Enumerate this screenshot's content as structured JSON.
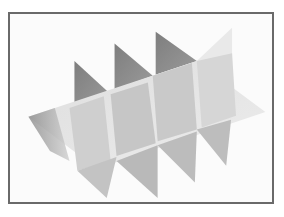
{
  "image": {
    "subject": "paper grid divider insert",
    "description": "Photograph of an interlocking white paper divider grid with one long panel and four cross panels, shown at an angle against a white background",
    "frame_color": "#6a6a6a",
    "background_color": "#fbfbfb",
    "panel_colors": {
      "light": "#e6e6e6",
      "mid": "#c9c9c9",
      "dark": "#8e8e8e",
      "shadow": "#b0b0b0"
    }
  }
}
